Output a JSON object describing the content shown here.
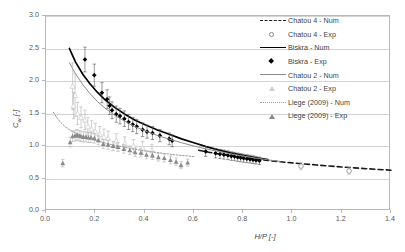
{
  "chart_data": {
    "type": "scatter",
    "title": "",
    "xlabel": "H/P [-]",
    "ylabel": "Cw [-]",
    "xlim": [
      0.0,
      1.4
    ],
    "ylim": [
      0.0,
      3.0
    ],
    "xticks": [
      "0.0",
      "0.2",
      "0.4",
      "0.6",
      "0.8",
      "1.0",
      "1.2",
      "1.4"
    ],
    "yticks": [
      "0.0",
      "0.5",
      "1.0",
      "1.5",
      "2.0",
      "2.5",
      "3.0"
    ],
    "grid": "horizontal",
    "legend_position": "right",
    "series": [
      {
        "name": "Chatou 4 - Num",
        "kind": "line",
        "style": "dashed",
        "color": "#1a1a1a",
        "points": [
          [
            0.62,
            0.935
          ],
          [
            0.66,
            0.905
          ],
          [
            0.7,
            0.878
          ],
          [
            0.74,
            0.855
          ],
          [
            0.78,
            0.833
          ],
          [
            0.82,
            0.813
          ],
          [
            0.86,
            0.795
          ],
          [
            0.9,
            0.778
          ],
          [
            0.95,
            0.758
          ],
          [
            1.0,
            0.74
          ],
          [
            1.05,
            0.723
          ],
          [
            1.1,
            0.707
          ],
          [
            1.15,
            0.692
          ],
          [
            1.2,
            0.678
          ],
          [
            1.25,
            0.664
          ],
          [
            1.3,
            0.651
          ],
          [
            1.35,
            0.639
          ],
          [
            1.4,
            0.628
          ]
        ]
      },
      {
        "name": "Chatou 4 - Exp",
        "kind": "scatter",
        "marker": "open-circle",
        "color": "#8a8a8a",
        "points": [
          [
            1.035,
            0.69,
            0.055
          ],
          [
            1.23,
            0.615,
            0.05
          ]
        ]
      },
      {
        "name": "Biskra - Num",
        "kind": "line",
        "style": "solid",
        "color": "#000000",
        "points": [
          [
            0.095,
            2.5
          ],
          [
            0.12,
            2.29
          ],
          [
            0.15,
            2.1
          ],
          [
            0.18,
            1.95
          ],
          [
            0.21,
            1.82
          ],
          [
            0.24,
            1.71
          ],
          [
            0.28,
            1.59
          ],
          [
            0.32,
            1.49
          ],
          [
            0.36,
            1.4
          ],
          [
            0.4,
            1.33
          ],
          [
            0.45,
            1.25
          ],
          [
            0.5,
            1.18
          ],
          [
            0.55,
            1.11
          ],
          [
            0.6,
            1.05
          ],
          [
            0.65,
            0.99
          ],
          [
            0.7,
            0.94
          ],
          [
            0.75,
            0.895
          ],
          [
            0.8,
            0.855
          ],
          [
            0.85,
            0.82
          ],
          [
            0.9,
            0.79
          ]
        ]
      },
      {
        "name": "Biskra - Exp",
        "kind": "scatter",
        "marker": "filled-diamond",
        "color": "#000000",
        "points": [
          [
            0.158,
            2.33,
            0.19
          ],
          [
            0.196,
            2.09,
            0.17
          ],
          [
            0.227,
            1.82,
            0.155
          ],
          [
            0.248,
            1.72,
            0.145
          ],
          [
            0.258,
            1.62,
            0.135
          ],
          [
            0.268,
            1.55,
            0.13
          ],
          [
            0.285,
            1.49,
            0.125
          ],
          [
            0.3,
            1.46,
            0.12
          ],
          [
            0.318,
            1.42,
            0.12
          ],
          [
            0.335,
            1.37,
            0.115
          ],
          [
            0.352,
            1.33,
            0.11
          ],
          [
            0.368,
            1.3,
            0.11
          ],
          [
            0.392,
            1.25,
            0.105
          ],
          [
            0.41,
            1.22,
            0.1
          ],
          [
            0.432,
            1.2,
            0.1
          ],
          [
            0.462,
            1.16,
            0.095
          ],
          [
            0.5,
            1.11,
            0.09
          ],
          [
            0.512,
            1.08,
            0.09
          ],
          [
            0.648,
            0.915,
            0.075
          ],
          [
            0.688,
            0.888,
            0.07
          ],
          [
            0.706,
            0.878,
            0.07
          ],
          [
            0.722,
            0.868,
            0.07
          ],
          [
            0.738,
            0.858,
            0.068
          ],
          [
            0.752,
            0.845,
            0.066
          ],
          [
            0.765,
            0.838,
            0.065
          ],
          [
            0.778,
            0.828,
            0.064
          ],
          [
            0.79,
            0.82,
            0.063
          ],
          [
            0.802,
            0.812,
            0.062
          ],
          [
            0.815,
            0.805,
            0.061
          ],
          [
            0.828,
            0.798,
            0.06
          ],
          [
            0.84,
            0.79,
            0.059
          ],
          [
            0.852,
            0.782,
            0.058
          ],
          [
            0.866,
            0.772,
            0.057
          ]
        ]
      },
      {
        "name": "Chatou 2 - Num",
        "kind": "line",
        "style": "solid",
        "color": "#8c8c8c",
        "points": [
          [
            0.095,
            2.28
          ],
          [
            0.12,
            2.11
          ],
          [
            0.15,
            1.94
          ],
          [
            0.18,
            1.8
          ],
          [
            0.21,
            1.68
          ],
          [
            0.24,
            1.58
          ],
          [
            0.28,
            1.47
          ],
          [
            0.32,
            1.38
          ],
          [
            0.36,
            1.3
          ],
          [
            0.4,
            1.235
          ],
          [
            0.45,
            1.165
          ],
          [
            0.5,
            1.105
          ],
          [
            0.55,
            1.05
          ],
          [
            0.6,
            1.0
          ],
          [
            0.65,
            0.955
          ],
          [
            0.7,
            0.915
          ],
          [
            0.75,
            0.878
          ],
          [
            0.8,
            0.845
          ],
          [
            0.85,
            0.815
          ],
          [
            0.9,
            0.788
          ],
          [
            0.95,
            0.762
          ]
        ]
      },
      {
        "name": "Chatou 2 - Exp",
        "kind": "scatter",
        "marker": "open-triangle",
        "color": "#cfcfcf",
        "points": [
          [
            0.108,
            1.92,
            0.36
          ],
          [
            0.118,
            1.78,
            0.33
          ],
          [
            0.112,
            1.62,
            0.2
          ],
          [
            0.128,
            1.5,
            0.17
          ],
          [
            0.142,
            1.44,
            0.16
          ],
          [
            0.158,
            1.4,
            0.15
          ],
          [
            0.17,
            1.3,
            0.14
          ],
          [
            0.185,
            1.26,
            0.13
          ],
          [
            0.2,
            1.22,
            0.13
          ],
          [
            0.218,
            1.18,
            0.12
          ],
          [
            0.235,
            1.14,
            0.12
          ],
          [
            0.252,
            1.12,
            0.11
          ],
          [
            0.285,
            1.08,
            0.11
          ],
          [
            0.32,
            1.04,
            0.1
          ],
          [
            0.355,
            1.0,
            0.1
          ],
          [
            0.392,
            0.97,
            0.1
          ],
          [
            0.43,
            0.93,
            0.095
          ]
        ]
      },
      {
        "name": "Liege (2009) - Num",
        "kind": "line",
        "style": "dotted",
        "color": "#9a9a9a",
        "points": [
          [
            0.03,
            1.52
          ],
          [
            0.045,
            1.43
          ],
          [
            0.06,
            1.36
          ],
          [
            0.08,
            1.29
          ],
          [
            0.1,
            1.24
          ],
          [
            0.125,
            1.19
          ],
          [
            0.15,
            1.15
          ],
          [
            0.18,
            1.11
          ],
          [
            0.21,
            1.08
          ],
          [
            0.245,
            1.04
          ],
          [
            0.28,
            1.01
          ],
          [
            0.32,
            0.98
          ],
          [
            0.36,
            0.95
          ],
          [
            0.4,
            0.925
          ],
          [
            0.45,
            0.9
          ],
          [
            0.5,
            0.875
          ],
          [
            0.55,
            0.855
          ],
          [
            0.6,
            0.838
          ]
        ]
      },
      {
        "name": "Liege (2009) - Exp",
        "kind": "scatter",
        "marker": "filled-triangle",
        "color": "#8a8a8a",
        "points": [
          [
            0.068,
            0.735,
            0.058
          ],
          [
            0.098,
            1.06,
            0.075
          ],
          [
            0.108,
            1.15,
            0.082
          ],
          [
            0.118,
            1.16,
            0.082
          ],
          [
            0.126,
            1.17,
            0.082
          ],
          [
            0.134,
            1.16,
            0.08
          ],
          [
            0.142,
            1.15,
            0.08
          ],
          [
            0.152,
            1.14,
            0.078
          ],
          [
            0.162,
            1.14,
            0.078
          ],
          [
            0.172,
            1.13,
            0.076
          ],
          [
            0.182,
            1.13,
            0.076
          ],
          [
            0.196,
            1.12,
            0.075
          ],
          [
            0.212,
            1.09,
            0.074
          ],
          [
            0.232,
            1.03,
            0.072
          ],
          [
            0.252,
            1.02,
            0.07
          ],
          [
            0.272,
            1.0,
            0.07
          ],
          [
            0.292,
            0.985,
            0.068
          ],
          [
            0.316,
            0.955,
            0.066
          ],
          [
            0.34,
            0.935,
            0.065
          ],
          [
            0.362,
            0.905,
            0.064
          ],
          [
            0.385,
            0.895,
            0.063
          ],
          [
            0.408,
            0.865,
            0.062
          ],
          [
            0.432,
            0.855,
            0.061
          ],
          [
            0.456,
            0.828,
            0.06
          ],
          [
            0.48,
            0.815,
            0.059
          ],
          [
            0.505,
            0.785,
            0.058
          ],
          [
            0.528,
            0.76,
            0.057
          ],
          [
            0.548,
            0.705,
            0.055
          ],
          [
            0.575,
            0.745,
            0.055
          ]
        ]
      }
    ]
  },
  "legend": {
    "items": [
      {
        "label": "Chatou 4 - Num",
        "key": "dash-black-line"
      },
      {
        "label": "Chatou 4 - Exp",
        "key": "open-circle-marker"
      },
      {
        "label": "Biskra - Num",
        "key": "solid-black-line"
      },
      {
        "label": "Biskra - Exp",
        "key": "filled-diamond-marker"
      },
      {
        "label": "Chatou 2 - Num",
        "key": "solid-gray-line"
      },
      {
        "label": "Chatou 2 - Exp",
        "key": "open-triangle-marker"
      },
      {
        "label": "Liege (2009) - Num",
        "key": "dotted-gray-line"
      },
      {
        "label": "Liege (2009) - Exp",
        "key": "filled-triangle-marker"
      }
    ]
  },
  "axes": {
    "x_label": "H/P [-]",
    "y_label_main": "C",
    "y_label_sub": "w",
    "y_label_unit": " [-]"
  }
}
